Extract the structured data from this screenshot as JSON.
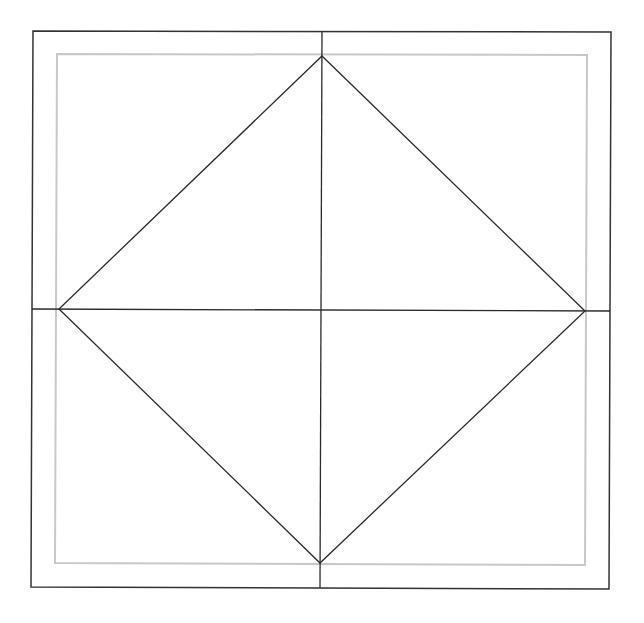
{
  "diagram": {
    "title": "",
    "background": "#ffffff",
    "colors": {
      "outer_square": "#333333",
      "inner_square": "#c8c8c8",
      "lines": "#2a2a2a"
    },
    "outer_square": {
      "points": [
        [
          33,
          31
        ],
        [
          611,
          32
        ],
        [
          609,
          589
        ],
        [
          31,
          587
        ]
      ]
    },
    "inner_square": {
      "points": [
        [
          57,
          54
        ],
        [
          587,
          55
        ],
        [
          585,
          565
        ],
        [
          55,
          563
        ]
      ]
    },
    "vertical_midline": {
      "x1": 322,
      "y1": 31,
      "x2": 320,
      "y2": 588
    },
    "horizontal_midline": {
      "x1": 32,
      "y1": 309,
      "x2": 610,
      "y2": 311
    },
    "diamond": {
      "points": [
        [
          322,
          56
        ],
        [
          585,
          311
        ],
        [
          320,
          563
        ],
        [
          59,
          309
        ]
      ]
    }
  }
}
